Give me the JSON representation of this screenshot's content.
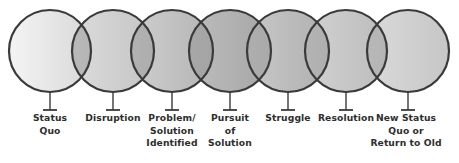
{
  "diagram": {
    "type": "overlapping-circles-process",
    "title": "",
    "canvas": {
      "width": 459,
      "height": 163,
      "background": "#ffffff"
    },
    "style": {
      "circle_stroke": "#3a3a3a",
      "circle_stroke_width": 2.2,
      "stem_color": "#3a3a3a",
      "label_color": "#2e2e2e",
      "overlap_shade": "#8f8f8f"
    },
    "geometry": {
      "circle_cy": 51,
      "circle_r": 41,
      "stem_top": 92,
      "stem_bottom": 110,
      "stem_cap_half_width": 7,
      "label_top": 112
    },
    "nodes": [
      {
        "id": "status-quo",
        "label": "Status\nQuo",
        "cx": 50,
        "fill_light": "#f4f4f4",
        "fill_dark": "#d8d8d8",
        "label_x": 50,
        "label_width": 62
      },
      {
        "id": "disruption",
        "label": "Disruption",
        "cx": 113,
        "fill_light": "#dcdcdc",
        "fill_dark": "#c4c4c4",
        "label_x": 113,
        "label_width": 66
      },
      {
        "id": "problem-solution-identified",
        "label": "Problem/\nSolution\nIdentified",
        "cx": 172,
        "fill_light": "#cfcfcf",
        "fill_dark": "#b4b4b4",
        "label_x": 172,
        "label_width": 66
      },
      {
        "id": "pursuit-of-solution",
        "label": "Pursuit\nof\nSolution",
        "cx": 230,
        "fill_light": "#bdbdbd",
        "fill_dark": "#a6a6a6",
        "label_x": 230,
        "label_width": 62
      },
      {
        "id": "struggle",
        "label": "Struggle",
        "cx": 288,
        "fill_light": "#c8c8c8",
        "fill_dark": "#b0b0b0",
        "label_x": 288,
        "label_width": 60
      },
      {
        "id": "resolution",
        "label": "Resolution",
        "cx": 346,
        "fill_light": "#d2d2d2",
        "fill_dark": "#bcbcbc",
        "label_x": 346,
        "label_width": 66
      },
      {
        "id": "new-status-quo",
        "label": "New Status\nQuo or\nReturn to Old",
        "cx": 408,
        "fill_light": "#dadada",
        "fill_dark": "#c6c6c6",
        "label_x": 406,
        "label_width": 90
      }
    ]
  }
}
